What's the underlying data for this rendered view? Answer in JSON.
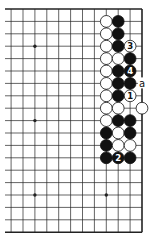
{
  "diagram": {
    "type": "go-board-partial",
    "visible_edges": [
      "top",
      "right",
      "bottom"
    ],
    "grid": {
      "columns_visible": 12,
      "rows": 19,
      "right_edge_x": 142,
      "left_cut_x": 5,
      "top_edge_y": 9,
      "col_spacing": 11.9,
      "row_spacing": 12.4,
      "note": "column index 0 = right edge, increasing leftward; row index 0 = top edge"
    },
    "colors": {
      "line": "#222222",
      "black_stone": "#111111",
      "white_stone": "#ffffff",
      "background": "#ffffff"
    },
    "star_points": [
      {
        "col": 9,
        "row": 3
      },
      {
        "col": 9,
        "row": 9
      },
      {
        "col": 9,
        "row": 15
      },
      {
        "col": 3,
        "row": 15
      }
    ],
    "stones": [
      {
        "col": 3,
        "row": 1,
        "color": "white"
      },
      {
        "col": 2,
        "row": 1,
        "color": "black"
      },
      {
        "col": 3,
        "row": 2,
        "color": "white"
      },
      {
        "col": 2,
        "row": 2,
        "color": "black"
      },
      {
        "col": 3,
        "row": 3,
        "color": "white"
      },
      {
        "col": 2,
        "row": 3,
        "color": "black"
      },
      {
        "col": 1,
        "row": 3,
        "color": "white",
        "label": "3"
      },
      {
        "col": 3,
        "row": 4,
        "color": "white"
      },
      {
        "col": 2,
        "row": 4,
        "color": "white"
      },
      {
        "col": 1,
        "row": 4,
        "color": "black"
      },
      {
        "col": 3,
        "row": 5,
        "color": "white"
      },
      {
        "col": 2,
        "row": 5,
        "color": "black"
      },
      {
        "col": 1,
        "row": 5,
        "color": "black",
        "label": "4"
      },
      {
        "col": 3,
        "row": 6,
        "color": "white"
      },
      {
        "col": 2,
        "row": 6,
        "color": "black"
      },
      {
        "col": 1,
        "row": 6,
        "color": "black"
      },
      {
        "col": 3,
        "row": 7,
        "color": "white"
      },
      {
        "col": 2,
        "row": 7,
        "color": "black"
      },
      {
        "col": 1,
        "row": 7,
        "color": "white",
        "label": "1"
      },
      {
        "col": 3,
        "row": 8,
        "color": "white"
      },
      {
        "col": 2,
        "row": 8,
        "color": "white"
      },
      {
        "col": 0,
        "row": 8,
        "color": "white"
      },
      {
        "col": 3,
        "row": 9,
        "color": "white"
      },
      {
        "col": 2,
        "row": 9,
        "color": "black"
      },
      {
        "col": 1,
        "row": 9,
        "color": "black"
      },
      {
        "col": 3,
        "row": 10,
        "color": "black"
      },
      {
        "col": 2,
        "row": 10,
        "color": "white"
      },
      {
        "col": 1,
        "row": 10,
        "color": "black"
      },
      {
        "col": 3,
        "row": 11,
        "color": "black"
      },
      {
        "col": 2,
        "row": 11,
        "color": "white"
      },
      {
        "col": 1,
        "row": 11,
        "color": "white"
      },
      {
        "col": 3,
        "row": 12,
        "color": "black"
      },
      {
        "col": 2,
        "row": 12,
        "color": "black",
        "label": "2"
      },
      {
        "col": 1,
        "row": 12,
        "color": "black"
      }
    ],
    "point_labels": [
      {
        "col": 0,
        "row": 6,
        "text": "a"
      }
    ]
  }
}
